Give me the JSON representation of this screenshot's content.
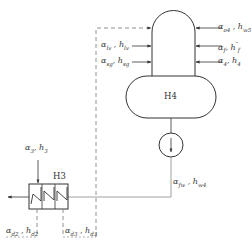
{
  "diagram": {
    "colors": {
      "line": "#333333",
      "dashed": "#666666",
      "background": "#ffffff"
    },
    "components": {
      "h4": {
        "label": "H4"
      },
      "h3": {
        "label": "H3"
      },
      "pump": {
        "label": "pump"
      }
    },
    "labels": {
      "lv": {
        "a": "α",
        "a_sub": "lv",
        "sep": " , ",
        "h": "h",
        "h_sub": "lv",
        "h_sup": ""
      },
      "sg": {
        "a": "α",
        "a_sub": "sg",
        "sep": ", ",
        "h": "h",
        "h_sub": "sg",
        "h_sup": ""
      },
      "o4": {
        "a": "α",
        "a_sub": "o4",
        "sep": " , ",
        "h": "h",
        "h_sub": "w5",
        "h_sup": ""
      },
      "f": {
        "a": "α",
        "a_sub": "f",
        "sep": ", ",
        "h": "h",
        "h_sub": "f",
        "h_sup": "″"
      },
      "four": {
        "a": "α",
        "a_sub": "4",
        "sep": ", ",
        "h": "h",
        "h_sub": "4",
        "h_sup": ""
      },
      "fw": {
        "a": "α",
        "a_sub": "fw",
        "sep": " , ",
        "h": "h",
        "h_sub": "w4",
        "h_sup": ""
      },
      "three": {
        "a": "α",
        "a_sub": "3",
        "sep": ", ",
        "h": "h",
        "h_sub": "3",
        "h_sup": ""
      },
      "d2": {
        "a": "α",
        "a_sub": "d2",
        "sep": " , ",
        "h": "h",
        "h_sub": "d2",
        "h_sup": ""
      },
      "d3": {
        "a": "α",
        "a_sub": "d3",
        "sep": " , ",
        "h": "h",
        "h_sub": "d3",
        "h_sup": ""
      }
    }
  }
}
